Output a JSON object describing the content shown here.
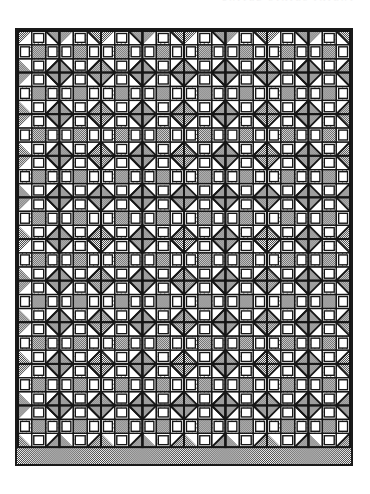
{
  "header": {
    "text": "UNITED  STATES   PATENT",
    "color": "#f2f2f2"
  },
  "figure": {
    "caption": "",
    "border_color": "#1a1a1a",
    "background_color": "#ffffff"
  },
  "diagram": {
    "type": "quilt-block-grid",
    "grid_columns": 8,
    "grid_rows": 10,
    "block_pixel_size": 42,
    "frame": {
      "x": 15,
      "y": 28,
      "width": 338,
      "height": 438
    },
    "block_name": "nine-patch-star",
    "patch_layout": [
      [
        "half-square-triangle",
        "rectangle-bar",
        "half-square-triangle"
      ],
      [
        "vertical-bar",
        "center-square",
        "vertical-bar"
      ],
      [
        "half-square-triangle",
        "rectangle-bar",
        "half-square-triangle"
      ]
    ],
    "fabrics": [
      {
        "id": "dark",
        "name": "dark-checkerboard",
        "label": "Dark print",
        "hex": "#9a9a9a",
        "texture": "dense-checker"
      },
      {
        "id": "light",
        "name": "light-dotted",
        "label": "Light dotted print",
        "hex": "#ffffff",
        "texture": "sparse-dots"
      },
      {
        "id": "plain",
        "name": "plain-white",
        "label": "Plain white",
        "hex": "#ffffff",
        "texture": "none"
      }
    ],
    "seam_line_color": "#161616",
    "seam_line_width": 1.4
  },
  "chart_data": {
    "type": "table",
    "categories": [
      "Dark print",
      "Light dotted print",
      "Plain white"
    ],
    "values": [
      48,
      32,
      20
    ],
    "xlabel": "Fabric",
    "ylabel": "Share of patches (%)",
    "grid": false,
    "legend_position": "none"
  }
}
